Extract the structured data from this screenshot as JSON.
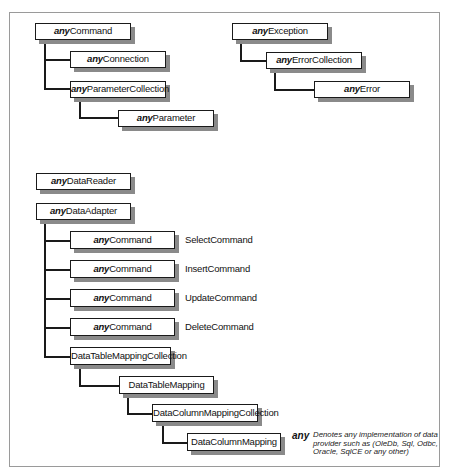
{
  "prefix": "any",
  "groups": {
    "command": {
      "root": {
        "prefix": "any",
        "name": "Command"
      },
      "connection": {
        "prefix": "any",
        "name": "Connection"
      },
      "parameter_collection": {
        "prefix": "any",
        "name": "ParameterCollection"
      },
      "parameter": {
        "prefix": "any",
        "name": "Parameter"
      }
    },
    "exception": {
      "root": {
        "prefix": "any",
        "name": "Exception"
      },
      "error_collection": {
        "prefix": "any",
        "name": "ErrorCollection"
      },
      "error": {
        "prefix": "any",
        "name": "Error"
      }
    },
    "data_reader": {
      "prefix": "any",
      "name": "DataReader"
    },
    "data_adapter": {
      "root": {
        "prefix": "any",
        "name": "DataAdapter"
      },
      "commands": [
        {
          "prefix": "any",
          "name": "Command",
          "role": "SelectCommand"
        },
        {
          "prefix": "any",
          "name": "Command",
          "role": "InsertCommand"
        },
        {
          "prefix": "any",
          "name": "Command",
          "role": "UpdateCommand"
        },
        {
          "prefix": "any",
          "name": "Command",
          "role": "DeleteCommand"
        }
      ],
      "table_mapping_collection": {
        "name": "DataTableMappingCollection"
      },
      "table_mapping": {
        "name": "DataTableMapping"
      },
      "column_mapping_collection": {
        "name": "DataColumnMappingCollection"
      },
      "column_mapping": {
        "name": "DataColumnMapping"
      }
    }
  },
  "legend": {
    "term": "any",
    "description": "Denotes any implementation of data provider such as (OleDb, Sql, Odbc, Oracle, SqlCE or any other)"
  }
}
